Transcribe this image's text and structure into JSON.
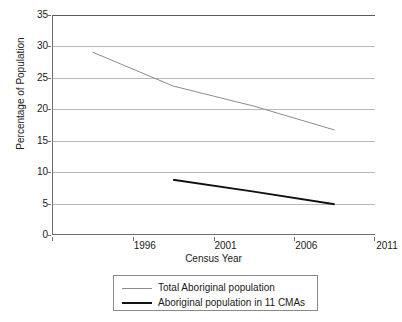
{
  "chart_data": {
    "type": "line",
    "title": "",
    "xlabel": "Census Year",
    "ylabel": "Percentage of Population",
    "categories": [
      "1996",
      "2001",
      "2006",
      "2011"
    ],
    "ylim": [
      0,
      35
    ],
    "yticks": [
      0,
      5,
      10,
      15,
      20,
      25,
      30,
      35
    ],
    "grid": true,
    "legend_position": "bottom",
    "series": [
      {
        "name": "Total Aboriginal population",
        "color": "#8c8c8c",
        "width": 1,
        "values": [
          29.1,
          23.7,
          20.5,
          16.7
        ]
      },
      {
        "name": "Aboriginal population in 11 CMAs",
        "color": "#111111",
        "width": 2,
        "values": [
          null,
          8.8,
          6.9,
          4.9
        ]
      }
    ]
  },
  "axes": {
    "y_title": "Percentage of Population",
    "x_title": "Census Year",
    "y_tick_labels": [
      "35",
      "30",
      "25",
      "20",
      "15",
      "10",
      "5",
      "0"
    ],
    "x_tick_labels": [
      "1996",
      "2001",
      "2006",
      "2011"
    ]
  },
  "legend": {
    "items": [
      {
        "label": "Total Aboriginal population",
        "color": "#8c8c8c"
      },
      {
        "label": "Aboriginal population in 11 CMAs",
        "color": "#111111"
      }
    ]
  }
}
